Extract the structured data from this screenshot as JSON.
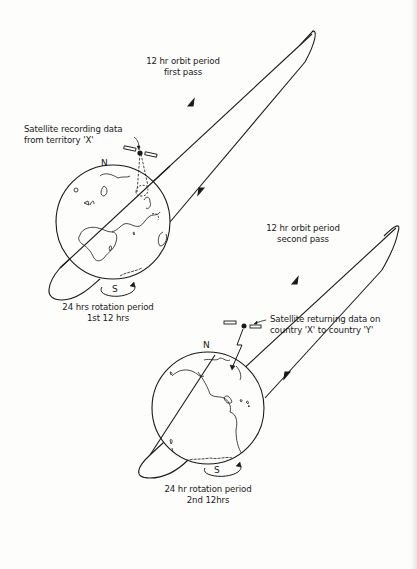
{
  "panel_top": {
    "orbit_label_line1": "12 hr orbit period",
    "orbit_label_line2": "first pass",
    "satellite_label_line1": "Satellite recording data",
    "satellite_label_line2": "from territory 'X'",
    "north_label": "N",
    "south_label": "S",
    "rotation_label_line1": "24 hrs rotation period",
    "rotation_label_line2": "1st 12 hrs"
  },
  "panel_bottom": {
    "orbit_label_line1": "12 hr orbit period",
    "orbit_label_line2": "second pass",
    "satellite_label_line1": "Satellite returning data on",
    "satellite_label_line2": "country 'X' to country 'Y'",
    "north_label": "N",
    "south_label": "S",
    "rotation_label_line1": "24 hr rotation period",
    "rotation_label_line2": "2nd 12hrs"
  },
  "colors": {
    "ink": "#1a1a1a",
    "paper": "#fdfdfb"
  }
}
